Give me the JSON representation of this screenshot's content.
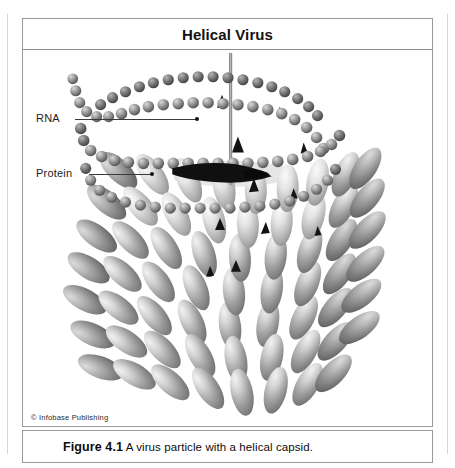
{
  "figure": {
    "panel_title": "Helical Virus",
    "credit": "© Infobase Publishing",
    "caption": {
      "figure_number": "Figure 4.1",
      "text": "A virus particle with a helical capsid."
    }
  },
  "callouts": [
    {
      "id": "rna",
      "label": "RNA",
      "target": "nucleic-acid-helix"
    },
    {
      "id": "protein",
      "label": "Protein",
      "target": "capsomere-subunit"
    }
  ],
  "illustration": {
    "subject": "helical virus particle",
    "parts": [
      "rna-helix",
      "helix-axis-rod",
      "protein-capsid-subunits"
    ],
    "colors": {
      "frame_border": "#9a9a9a",
      "title_text": "#111111",
      "leader_line": "#3a3a3a",
      "helix_bead_light": "#c9c9c9",
      "helix_bead_dark": "#4e4e4e",
      "capsid_light": "#eaeaea",
      "capsid_mid": "#9b9b9b",
      "capsid_dark": "#595959",
      "gap_shadow": "#111111",
      "axis_rod": "#8c8c8c",
      "background": "#ffffff"
    }
  }
}
